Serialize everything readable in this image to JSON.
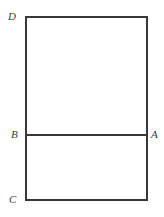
{
  "figure": {
    "type": "geometry-diagram",
    "canvas": {
      "width": 164,
      "height": 217,
      "background_color": "#ffffff"
    },
    "style": {
      "stroke_color": "#383838",
      "stroke_width": 2,
      "fill": "none",
      "label_color": "#3a3a3a",
      "label_font_style": "italic",
      "label_font_size": 11
    },
    "outer_rectangle": {
      "x": 26,
      "y": 17,
      "width": 121,
      "height": 183
    },
    "divider_segment": {
      "name": "BA",
      "y": 135,
      "x_start": 26,
      "x_end": 147
    },
    "vertices": [
      {
        "label": "D",
        "corner": "top-left",
        "x": 26,
        "y": 17
      },
      {
        "label": "B",
        "corner": "middle-left",
        "x": 26,
        "y": 135
      },
      {
        "label": "A",
        "corner": "middle-right",
        "x": 147,
        "y": 135
      },
      {
        "label": "C",
        "corner": "bottom-left",
        "x": 26,
        "y": 200
      }
    ],
    "regions": [
      {
        "name": "upper-rectangle",
        "top": 17,
        "bottom": 135,
        "height": 118
      },
      {
        "name": "lower-rectangle",
        "top": 135,
        "bottom": 200,
        "height": 65
      }
    ]
  }
}
